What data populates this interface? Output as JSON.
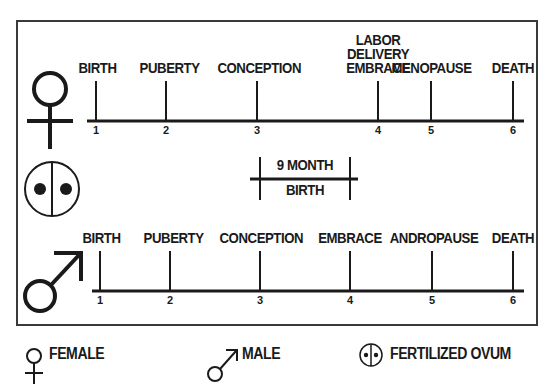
{
  "female_timeline": {
    "events": [
      {
        "label": "BIRTH",
        "number": "1"
      },
      {
        "label": "PUBERTY",
        "number": "2"
      },
      {
        "label": "CONCEPTION",
        "number": "3"
      },
      {
        "label_lines": [
          "LABOR",
          "DELIVERY",
          "EMBRACE"
        ],
        "number": "4"
      },
      {
        "label": "MENOPAUSE",
        "number": "5"
      },
      {
        "label": "DEATH",
        "number": "6"
      }
    ]
  },
  "gestation_marker": {
    "top": "9 MONTH",
    "bottom": "BIRTH"
  },
  "male_timeline": {
    "events": [
      {
        "label": "BIRTH",
        "number": "1"
      },
      {
        "label": "PUBERTY",
        "number": "2"
      },
      {
        "label": "CONCEPTION",
        "number": "3"
      },
      {
        "label": "EMBRACE",
        "number": "4"
      },
      {
        "label": "ANDROPAUSE",
        "number": "5"
      },
      {
        "label": "DEATH",
        "number": "6"
      }
    ]
  },
  "legend": {
    "female": "FEMALE",
    "male": "MALE",
    "ovum": "FERTILIZED OVUM"
  },
  "icons": {
    "female": "female-symbol-icon",
    "male": "male-symbol-icon",
    "ovum": "fertilized-ovum-icon"
  },
  "colors": {
    "ink": "#1a1a1a",
    "frame": "#3a3a3a",
    "background": "#ffffff"
  }
}
